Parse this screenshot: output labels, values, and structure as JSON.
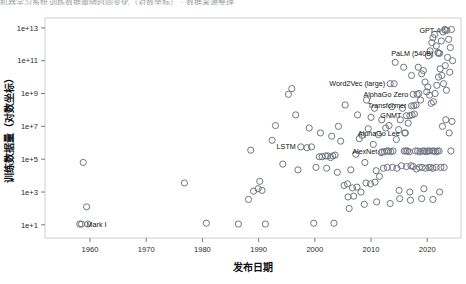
{
  "clipped_header": "机器学习系统训练数据量随时间变化（对数坐标）  ·  数据来源整理",
  "chart_data": {
    "type": "scatter",
    "title": "",
    "xlabel": "发布日期",
    "ylabel": "训练数据量（对数坐标）",
    "xlim": [
      1952,
      2026
    ],
    "ylim_log10": [
      0.2,
      13.6
    ],
    "xticks": [
      1960,
      1970,
      1980,
      1990,
      2000,
      2010,
      2020
    ],
    "xtick_labels": [
      "1960",
      "1970",
      "1980",
      "1990",
      "2000",
      "2010",
      "2020"
    ],
    "yticks_log10": [
      1,
      3,
      5,
      7,
      9,
      11,
      13
    ],
    "ytick_labels": [
      "1e+1",
      "1e+3",
      "1e+5",
      "1e+7",
      "1e+9",
      "1e+11",
      "1e+13"
    ],
    "grid": false,
    "legend": "none",
    "marker": "open-circle",
    "marker_color": "#6f7780",
    "annotations": [
      {
        "label": "Mark I",
        "x": 1958.5,
        "y_log10": 1.05,
        "anchor": "left"
      },
      {
        "label": "LSTM",
        "x": 1997.5,
        "y_log10": 5.75,
        "anchor": "right"
      },
      {
        "label": "AlexNet",
        "x": 2012.0,
        "y_log10": 5.45,
        "anchor": "right"
      },
      {
        "label": "AlphaGo Lee",
        "x": 2016.0,
        "y_log10": 6.6,
        "anchor": "right"
      },
      {
        "label": "GNMT",
        "x": 2016.3,
        "y_log10": 7.65,
        "anchor": "right"
      },
      {
        "label": "Transformer",
        "x": 2017.2,
        "y_log10": 8.25,
        "anchor": "right"
      },
      {
        "label": "AlphaGo Zero",
        "x": 2017.5,
        "y_log10": 8.95,
        "anchor": "right"
      },
      {
        "label": "Word2Vec (large)",
        "x": 2013.4,
        "y_log10": 9.6,
        "anchor": "right"
      },
      {
        "label": "PaLM (540B)",
        "x": 2022.0,
        "y_log10": 11.45,
        "anchor": "right"
      },
      {
        "label": "GPT-4",
        "x": 2023.2,
        "y_log10": 12.85,
        "anchor": "right"
      }
    ],
    "points": [
      {
        "x": 1958.2,
        "y_log10": 1.05
      },
      {
        "x": 1959.6,
        "y_log10": 1.05
      },
      {
        "x": 1959.4,
        "y_log10": 2.1
      },
      {
        "x": 1958.8,
        "y_log10": 4.8
      },
      {
        "x": 1976.8,
        "y_log10": 3.55
      },
      {
        "x": 1980.7,
        "y_log10": 1.1
      },
      {
        "x": 1986.4,
        "y_log10": 1.05
      },
      {
        "x": 1988.2,
        "y_log10": 2.55
      },
      {
        "x": 1989.1,
        "y_log10": 3.05
      },
      {
        "x": 1989.9,
        "y_log10": 3.2
      },
      {
        "x": 1990.6,
        "y_log10": 3.1
      },
      {
        "x": 1990.2,
        "y_log10": 3.65
      },
      {
        "x": 1991.2,
        "y_log10": 1.05
      },
      {
        "x": 1988.6,
        "y_log10": 5.55
      },
      {
        "x": 1992.4,
        "y_log10": 6.15
      },
      {
        "x": 1993.0,
        "y_log10": 7.05
      },
      {
        "x": 1994.3,
        "y_log10": 4.7
      },
      {
        "x": 1995.3,
        "y_log10": 8.95
      },
      {
        "x": 1995.9,
        "y_log10": 9.3
      },
      {
        "x": 1996.6,
        "y_log10": 7.7
      },
      {
        "x": 1997.0,
        "y_log10": 4.35
      },
      {
        "x": 1998.6,
        "y_log10": 5.7
      },
      {
        "x": 1999.4,
        "y_log10": 5.75
      },
      {
        "x": 2000.2,
        "y_log10": 4.5
      },
      {
        "x": 2000.8,
        "y_log10": 5.15
      },
      {
        "x": 2001.3,
        "y_log10": 5.15
      },
      {
        "x": 2001.9,
        "y_log10": 5.2
      },
      {
        "x": 2002.3,
        "y_log10": 5.2
      },
      {
        "x": 2002.8,
        "y_log10": 5.1
      },
      {
        "x": 2003.2,
        "y_log10": 5.2
      },
      {
        "x": 2003.6,
        "y_log10": 5.25
      },
      {
        "x": 2002.1,
        "y_log10": 4.45
      },
      {
        "x": 2004.0,
        "y_log10": 4.2
      },
      {
        "x": 2004.6,
        "y_log10": 6.1
      },
      {
        "x": 2005.2,
        "y_log10": 3.4
      },
      {
        "x": 2005.8,
        "y_log10": 3.5
      },
      {
        "x": 2006.4,
        "y_log10": 4.35
      },
      {
        "x": 2006.9,
        "y_log10": 2.75
      },
      {
        "x": 2007.3,
        "y_log10": 5.3
      },
      {
        "x": 2007.9,
        "y_log10": 6.25
      },
      {
        "x": 2008.4,
        "y_log10": 6.45
      },
      {
        "x": 2008.9,
        "y_log10": 4.8
      },
      {
        "x": 2009.5,
        "y_log10": 6.85
      },
      {
        "x": 2010.0,
        "y_log10": 7.55
      },
      {
        "x": 2010.4,
        "y_log10": 5.9
      },
      {
        "x": 2010.9,
        "y_log10": 4.3
      },
      {
        "x": 2011.3,
        "y_log10": 6.5
      },
      {
        "x": 2011.8,
        "y_log10": 5.4
      },
      {
        "x": 2012.4,
        "y_log10": 5.45
      },
      {
        "x": 2012.8,
        "y_log10": 5.5
      },
      {
        "x": 2013.1,
        "y_log10": 5.5
      },
      {
        "x": 2013.5,
        "y_log10": 5.45
      },
      {
        "x": 2013.9,
        "y_log10": 5.5
      },
      {
        "x": 2013.2,
        "y_log10": 7.05
      },
      {
        "x": 2013.7,
        "y_log10": 8.2
      },
      {
        "x": 2014.1,
        "y_log10": 9.6
      },
      {
        "x": 2014.5,
        "y_log10": 6.2
      },
      {
        "x": 2014.9,
        "y_log10": 6.8
      },
      {
        "x": 2015.2,
        "y_log10": 7.4
      },
      {
        "x": 2015.6,
        "y_log10": 8.1
      },
      {
        "x": 2015.9,
        "y_log10": 5.5
      },
      {
        "x": 2016.2,
        "y_log10": 5.5
      },
      {
        "x": 2016.5,
        "y_log10": 5.5
      },
      {
        "x": 2016.8,
        "y_log10": 5.45
      },
      {
        "x": 2016.1,
        "y_log10": 6.6
      },
      {
        "x": 2016.6,
        "y_log10": 7.2
      },
      {
        "x": 2016.9,
        "y_log10": 7.65
      },
      {
        "x": 2017.3,
        "y_log10": 7.7
      },
      {
        "x": 2017.7,
        "y_log10": 7.75
      },
      {
        "x": 2017.6,
        "y_log10": 8.25
      },
      {
        "x": 2018.0,
        "y_log10": 8.3
      },
      {
        "x": 2018.2,
        "y_log10": 8.95
      },
      {
        "x": 2018.5,
        "y_log10": 9.0
      },
      {
        "x": 2018.8,
        "y_log10": 8.6
      },
      {
        "x": 2019.0,
        "y_log10": 10.2
      },
      {
        "x": 2019.3,
        "y_log10": 10.4
      },
      {
        "x": 2019.6,
        "y_log10": 9.7
      },
      {
        "x": 2019.9,
        "y_log10": 9.1
      },
      {
        "x": 2020.2,
        "y_log10": 11.3
      },
      {
        "x": 2020.5,
        "y_log10": 11.6
      },
      {
        "x": 2020.8,
        "y_log10": 12.1
      },
      {
        "x": 2021.0,
        "y_log10": 12.4
      },
      {
        "x": 2021.3,
        "y_log10": 12.6
      },
      {
        "x": 2021.6,
        "y_log10": 11.9
      },
      {
        "x": 2021.9,
        "y_log10": 11.5
      },
      {
        "x": 2022.2,
        "y_log10": 11.45
      },
      {
        "x": 2022.5,
        "y_log10": 12.2
      },
      {
        "x": 2022.8,
        "y_log10": 12.75
      },
      {
        "x": 2023.1,
        "y_log10": 12.9
      },
      {
        "x": 2023.5,
        "y_log10": 12.85
      },
      {
        "x": 2023.8,
        "y_log10": 12.3
      },
      {
        "x": 2024.1,
        "y_log10": 11.8
      },
      {
        "x": 2020.1,
        "y_log10": 9.4
      },
      {
        "x": 2020.4,
        "y_log10": 8.9
      },
      {
        "x": 2020.7,
        "y_log10": 8.4
      },
      {
        "x": 2021.1,
        "y_log10": 8.5
      },
      {
        "x": 2021.4,
        "y_log10": 9.0
      },
      {
        "x": 2021.7,
        "y_log10": 9.5
      },
      {
        "x": 2022.0,
        "y_log10": 10.0
      },
      {
        "x": 2022.3,
        "y_log10": 10.5
      },
      {
        "x": 2022.6,
        "y_log10": 10.1
      },
      {
        "x": 2022.9,
        "y_log10": 9.6
      },
      {
        "x": 2023.2,
        "y_log10": 10.7
      },
      {
        "x": 2023.6,
        "y_log10": 11.2
      },
      {
        "x": 2019.2,
        "y_log10": 5.5
      },
      {
        "x": 2019.5,
        "y_log10": 5.5
      },
      {
        "x": 2019.8,
        "y_log10": 5.45
      },
      {
        "x": 2020.1,
        "y_log10": 5.5
      },
      {
        "x": 2020.4,
        "y_log10": 5.5
      },
      {
        "x": 2020.9,
        "y_log10": 5.5
      },
      {
        "x": 2021.2,
        "y_log10": 5.5
      },
      {
        "x": 2021.5,
        "y_log10": 5.45
      },
      {
        "x": 2021.8,
        "y_log10": 5.5
      },
      {
        "x": 2022.1,
        "y_log10": 5.5
      },
      {
        "x": 2017.9,
        "y_log10": 5.5
      },
      {
        "x": 2018.3,
        "y_log10": 5.5
      },
      {
        "x": 2018.7,
        "y_log10": 5.45
      },
      {
        "x": 2017.1,
        "y_log10": 4.6
      },
      {
        "x": 2017.5,
        "y_log10": 4.55
      },
      {
        "x": 2018.1,
        "y_log10": 4.4
      },
      {
        "x": 2018.6,
        "y_log10": 4.5
      },
      {
        "x": 2019.1,
        "y_log10": 4.5
      },
      {
        "x": 2019.7,
        "y_log10": 4.45
      },
      {
        "x": 2020.3,
        "y_log10": 4.5
      },
      {
        "x": 2020.6,
        "y_log10": 4.5
      },
      {
        "x": 2021.0,
        "y_log10": 4.45
      },
      {
        "x": 2021.6,
        "y_log10": 4.5
      },
      {
        "x": 2022.4,
        "y_log10": 4.5
      },
      {
        "x": 2023.0,
        "y_log10": 4.5
      },
      {
        "x": 2016.3,
        "y_log10": 4.55
      },
      {
        "x": 2015.4,
        "y_log10": 4.6
      },
      {
        "x": 2014.6,
        "y_log10": 4.45
      },
      {
        "x": 2013.8,
        "y_log10": 4.5
      },
      {
        "x": 2012.9,
        "y_log10": 4.5
      },
      {
        "x": 2012.2,
        "y_log10": 4.45
      },
      {
        "x": 2011.5,
        "y_log10": 3.95
      },
      {
        "x": 2010.7,
        "y_log10": 3.6
      },
      {
        "x": 2009.9,
        "y_log10": 3.5
      },
      {
        "x": 2009.1,
        "y_log10": 3.55
      },
      {
        "x": 2008.2,
        "y_log10": 3.0
      },
      {
        "x": 2007.5,
        "y_log10": 3.3
      },
      {
        "x": 2006.7,
        "y_log10": 3.25
      },
      {
        "x": 2005.9,
        "y_log10": 2.7
      },
      {
        "x": 1999.8,
        "y_log10": 1.1
      },
      {
        "x": 2003.4,
        "y_log10": 1.1
      },
      {
        "x": 2006.1,
        "y_log10": 2.0
      },
      {
        "x": 2008.8,
        "y_log10": 2.25
      },
      {
        "x": 2011.0,
        "y_log10": 2.4
      },
      {
        "x": 2013.4,
        "y_log10": 2.3
      },
      {
        "x": 2015.1,
        "y_log10": 2.6
      },
      {
        "x": 2017.0,
        "y_log10": 2.5
      },
      {
        "x": 2019.0,
        "y_log10": 2.6
      },
      {
        "x": 2021.0,
        "y_log10": 2.55
      },
      {
        "x": 2012.6,
        "y_log10": 6.9
      },
      {
        "x": 2011.9,
        "y_log10": 7.4
      },
      {
        "x": 2010.6,
        "y_log10": 8.1
      },
      {
        "x": 2009.2,
        "y_log10": 8.6
      },
      {
        "x": 2007.6,
        "y_log10": 7.7
      },
      {
        "x": 2005.4,
        "y_log10": 8.3
      },
      {
        "x": 2004.2,
        "y_log10": 7.0
      },
      {
        "x": 2003.0,
        "y_log10": 6.4
      },
      {
        "x": 2001.0,
        "y_log10": 6.6
      },
      {
        "x": 1999.0,
        "y_log10": 6.9
      },
      {
        "x": 2014.3,
        "y_log10": 10.9
      },
      {
        "x": 2015.8,
        "y_log10": 10.6
      },
      {
        "x": 2017.2,
        "y_log10": 10.1
      },
      {
        "x": 2018.4,
        "y_log10": 10.6
      },
      {
        "x": 2023.4,
        "y_log10": 9.2
      },
      {
        "x": 2024.0,
        "y_log10": 10.3
      },
      {
        "x": 2024.3,
        "y_log10": 12.9
      },
      {
        "x": 2024.5,
        "y_log10": 11.0
      },
      {
        "x": 2023.9,
        "y_log10": 6.6
      },
      {
        "x": 2024.2,
        "y_log10": 5.5
      },
      {
        "x": 2024.4,
        "y_log10": 7.3
      },
      {
        "x": 2023.3,
        "y_log10": 7.4
      },
      {
        "x": 2022.7,
        "y_log10": 7.0
      },
      {
        "x": 2015.0,
        "y_log10": 3.1
      },
      {
        "x": 2016.9,
        "y_log10": 3.0
      },
      {
        "x": 2019.4,
        "y_log10": 3.2
      },
      {
        "x": 2022.2,
        "y_log10": 3.0
      }
    ]
  }
}
